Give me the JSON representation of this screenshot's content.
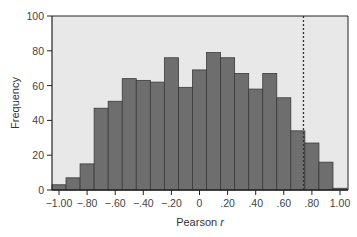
{
  "chart_data": {
    "type": "bar",
    "title": "",
    "xlabel": "Pearson r",
    "xlabel_main": "Pearson ",
    "xlabel_italic": "r",
    "ylabel": "Frequency",
    "xlim": [
      -1.05,
      1.05
    ],
    "ylim": [
      0,
      100
    ],
    "grid": false,
    "legend": null,
    "bin_width": 0.1,
    "categories": [
      -1.0,
      -0.9,
      -0.8,
      -0.7,
      -0.6,
      -0.5,
      -0.4,
      -0.3,
      -0.2,
      -0.1,
      0.0,
      0.1,
      0.2,
      0.3,
      0.4,
      0.5,
      0.6,
      0.7,
      0.8,
      0.9,
      1.0
    ],
    "values": [
      3,
      7,
      15,
      47,
      51,
      64,
      63,
      62,
      76,
      59,
      69,
      79,
      76,
      67,
      58,
      67,
      53,
      34,
      27,
      16,
      1
    ],
    "x_ticks": [
      -1.0,
      -0.8,
      -0.6,
      -0.4,
      -0.2,
      0.0,
      0.2,
      0.4,
      0.6,
      0.8,
      1.0
    ],
    "x_tick_labels": [
      "−1.00",
      "−.80",
      "−.60",
      "−.40",
      "−.20",
      "0",
      ".20",
      ".40",
      ".60",
      ".80",
      "1.00"
    ],
    "y_ticks": [
      0,
      20,
      40,
      60,
      80,
      100
    ],
    "y_tick_labels": [
      "0",
      "20",
      "40",
      "60",
      "80",
      "100"
    ],
    "annotations": [
      {
        "type": "vline",
        "x": 0.74,
        "style": "dashed"
      }
    ]
  },
  "colors": {
    "bar_fill": "#6e6e6e",
    "bar_edge": "#3a3a3a",
    "plot_bg": "#e8e8e8",
    "axis": "#222222",
    "vline": "#333333"
  }
}
